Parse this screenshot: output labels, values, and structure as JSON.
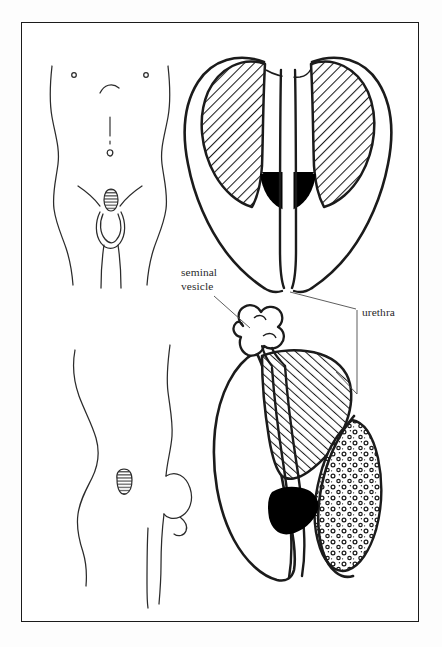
{
  "figure": {
    "kind": "anatomical-line-illustration",
    "frame": {
      "border_color": "#1b1b1b",
      "background_color": "#ffffff"
    },
    "colors": {
      "ink": "#1b1b1b",
      "hatch": "#1b1b1b",
      "solid_fill": "#000000",
      "stipple": "#1b1b1b",
      "page_background": "#fdfdfd",
      "label_text": "#2a2a2a"
    },
    "labels": [
      {
        "name": "seminal-vesicle",
        "lines": [
          "seminal",
          "vesicle"
        ],
        "line1": "seminal",
        "line2": "vesicle",
        "leader": "diagonal line to lobed vesicle in lower diagram"
      },
      {
        "name": "urethra",
        "lines": [
          "urethra"
        ],
        "line1": "urethra",
        "leader": "bracket with two leaders, one to upper diagram, one to lower diagram"
      }
    ],
    "panels": [
      {
        "name": "torso-front-view",
        "description": "frontal outline of male torso with nipples, sternum line, navel and hatched prostate marker at pubis"
      },
      {
        "name": "prostate-coronal-section",
        "description": "coronal section of prostate, two hatched lateral lobes, central urethra channel, solid black region"
      },
      {
        "name": "torso-side-view",
        "description": "profile outline of male torso and buttock with small hatched prostate marker"
      },
      {
        "name": "prostate-sagittal-section",
        "description": "sagittal section of prostate with seminal vesicle, hatched lobe, solid black region and stippled lobe"
      }
    ],
    "fills": {
      "hatch_label": "diagonal line hatching",
      "solid_label": "solid black",
      "stipple_label": "circular stipple"
    }
  }
}
